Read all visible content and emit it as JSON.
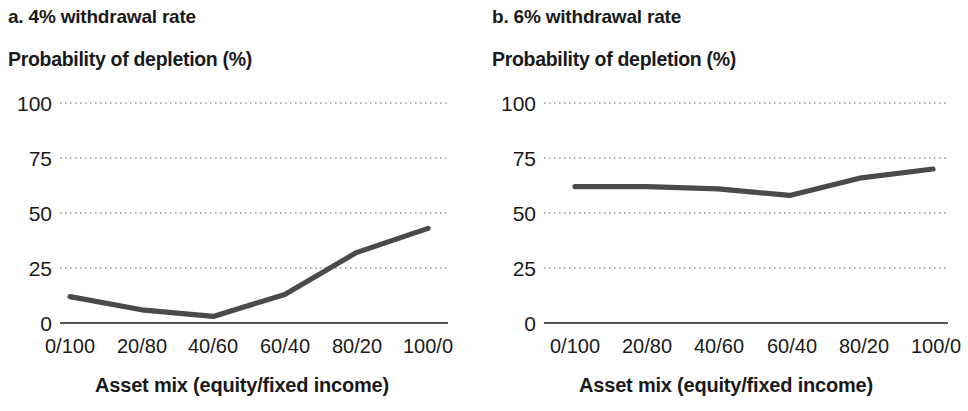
{
  "figure": {
    "background": "#ffffff",
    "line_color": "#4a4a4a",
    "axis_color": "#555555",
    "grid_color": "#9a9a9a"
  },
  "panels": [
    {
      "title": "a. 4% withdrawal rate",
      "y_axis_title": "Probability of depletion (%)",
      "x_axis_title": "Asset mix (equity/fixed income)",
      "y_ticks": [
        "100",
        "75",
        "50",
        "25",
        "0"
      ],
      "x_ticks": [
        "0/100",
        "20/80",
        "40/60",
        "60/40",
        "80/20",
        "100/0"
      ]
    },
    {
      "title": "b. 6% withdrawal rate",
      "y_axis_title": "Probability of depletion (%)",
      "x_axis_title": "Asset mix (equity/fixed income)",
      "y_ticks": [
        "100",
        "75",
        "50",
        "25",
        "0"
      ],
      "x_ticks": [
        "0/100",
        "20/80",
        "40/60",
        "60/40",
        "80/20",
        "100/0"
      ]
    }
  ],
  "chart_data": [
    {
      "type": "line",
      "title": "a. 4% withdrawal rate",
      "xlabel": "Asset mix (equity/fixed income)",
      "ylabel": "Probability of depletion (%)",
      "categories": [
        "0/100",
        "20/80",
        "40/60",
        "60/40",
        "80/20",
        "100/0"
      ],
      "values": [
        12,
        6,
        3,
        13,
        32,
        43
      ],
      "ylim": [
        0,
        100
      ],
      "yticks": [
        0,
        25,
        50,
        75,
        100
      ],
      "grid": true,
      "legend": "none"
    },
    {
      "type": "line",
      "title": "b. 6% withdrawal rate",
      "xlabel": "Asset mix (equity/fixed income)",
      "ylabel": "Probability of depletion (%)",
      "categories": [
        "0/100",
        "20/80",
        "40/60",
        "60/40",
        "80/20",
        "100/0"
      ],
      "values": [
        62,
        62,
        61,
        58,
        66,
        70
      ],
      "ylim": [
        0,
        100
      ],
      "yticks": [
        0,
        25,
        50,
        75,
        100
      ],
      "grid": true,
      "legend": "none"
    }
  ]
}
